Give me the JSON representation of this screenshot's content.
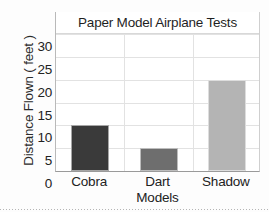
{
  "chart_data": {
    "type": "bar",
    "title": "Paper Model Airplane Tests",
    "xlabel": "Models",
    "ylabel": "Distance Flown ( feet )",
    "categories": [
      "Cobra",
      "Dart",
      "Shadow"
    ],
    "values": [
      10,
      5,
      20
    ],
    "ylim": [
      0,
      30
    ],
    "ytick_labels": [
      "0",
      "5",
      "10",
      "15",
      "20",
      "25",
      "30"
    ],
    "ytick_values": [
      0,
      5,
      10,
      15,
      20,
      25,
      30
    ],
    "grid": "horizontal-and-vertical",
    "legend": "none",
    "bar_colors": [
      "#3a3a3a",
      "#6e6e6e",
      "#b4b4b4"
    ],
    "series": [
      {
        "name": "Distance Flown",
        "points": [
          {
            "category": "Cobra",
            "value": 10,
            "color": "#3a3a3a"
          },
          {
            "category": "Dart",
            "value": 5,
            "color": "#6e6e6e"
          },
          {
            "category": "Shadow",
            "value": 20,
            "color": "#b4b4b4"
          }
        ]
      }
    ]
  }
}
